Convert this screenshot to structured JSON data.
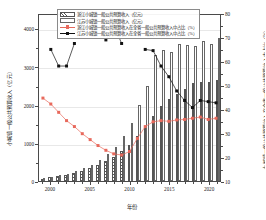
{
  "chart_data": {
    "type": "bar",
    "title": "",
    "xlabel": "年份",
    "ylabel": "小城镇一般公共预算收入（亿元）",
    "y2label": "小城镇一般公共预算收入在全省一般公共预算收入中占比（%）",
    "grid": true,
    "legend_position": "top-left",
    "x": [
      1999,
      2000,
      2001,
      2002,
      2003,
      2004,
      2005,
      2006,
      2007,
      2008,
      2009,
      2010,
      2011,
      2012,
      2013,
      2014,
      2015,
      2016,
      2017,
      2018,
      2019,
      2020,
      2021
    ],
    "xticks": [
      "2000",
      "2005",
      "2010",
      "2015",
      "2020"
    ],
    "xtick_values": [
      2000,
      2005,
      2010,
      2015,
      2020
    ],
    "ylim": [
      0,
      4400
    ],
    "yticks": [
      "0",
      "1000",
      "2000",
      "3000",
      "4000"
    ],
    "ytick_values": [
      0,
      1000,
      2000,
      3000,
      4000
    ],
    "y2lim": [
      10,
      80
    ],
    "y2ticks": [
      "10",
      "20",
      "30",
      "40",
      "50",
      "60",
      "70",
      "80"
    ],
    "y2tick_values": [
      10,
      20,
      30,
      40,
      50,
      60,
      70,
      80
    ],
    "series": [
      {
        "name": "浙江小城镇一般公共预算收入（亿元）",
        "type": "bar",
        "style": "hatched",
        "axis": "left",
        "values": [
          60,
          95,
          120,
          150,
          200,
          260,
          330,
          420,
          520,
          640,
          780,
          950,
          1180,
          1430,
          1700,
          1960,
          2140,
          2280,
          2420,
          2560,
          2600,
          2600,
          2640
        ]
      },
      {
        "name": "江苏小城镇一般公共预算收入（亿元）",
        "type": "bar",
        "style": "outline",
        "axis": "left",
        "values": [
          80,
          110,
          150,
          190,
          250,
          330,
          430,
          560,
          700,
          900,
          1180,
          1520,
          2000,
          2480,
          3290,
          3440,
          3380,
          3580,
          3560,
          3540,
          3660,
          3580,
          3740
        ]
      },
      {
        "name": "浙江小城镇一般公共预算收入在全省一般公共预算收入中占比（%）",
        "type": "line",
        "color": "#e8695c",
        "marker": "square",
        "axis": "right",
        "values": [
          45.0,
          42.5,
          39.0,
          35.5,
          33.0,
          30.0,
          27.5,
          25.0,
          23.0,
          21.5,
          21.0,
          22.5,
          28.0,
          33.0,
          35.0,
          35.5,
          35.2,
          35.8,
          36.0,
          36.5,
          37.0,
          36.0,
          36.5
        ]
      },
      {
        "name": "江苏小城镇一般公共预算收入在全省一般公共预算收入中占比（%）",
        "type": "line",
        "color": "#111111",
        "marker": "square",
        "axis": "right",
        "values": [
          null,
          65.5,
          58.5,
          58.5,
          68.0,
          null,
          null,
          null,
          69.5,
          76.0,
          68.0,
          null,
          null,
          65.5,
          65.0,
          58.5,
          54.0,
          48.0,
          44.0,
          41.0,
          44.0,
          43.5,
          43.0
        ]
      }
    ]
  },
  "legend": {
    "items": [
      {
        "label": "浙江小城镇一般公共预算收入（亿元）",
        "key": "zj"
      },
      {
        "label": "江苏小城镇一般公共预算收入（亿元）",
        "key": "js"
      },
      {
        "label": "浙江小城镇一般公共预算收入在全省一般公共预算收入中占比（%）",
        "key": "red"
      },
      {
        "label": "江苏小城镇一般公共预算收入在全省一般公共预算收入中占比（%）",
        "key": "blk"
      }
    ]
  }
}
